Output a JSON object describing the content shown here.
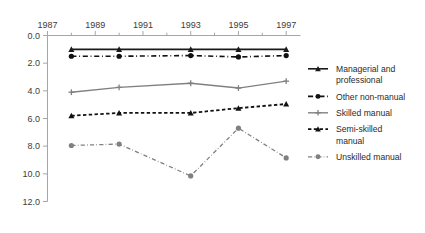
{
  "chart_data": {
    "type": "line",
    "title": "",
    "subtitle": "",
    "xlabel": "",
    "ylabel": "",
    "x": [
      1988,
      1990,
      1993,
      1995,
      1997
    ],
    "xlim": [
      1987,
      1997.6
    ],
    "ylim": [
      0.0,
      12.0
    ],
    "y_axis_inverted": true,
    "x_axis_position": "top",
    "grid": false,
    "legend_position": "right",
    "x_tick_labels": [
      "1987",
      "1989",
      "1991",
      "1993",
      "1995",
      "1997"
    ],
    "x_tick_values": [
      1987,
      1989,
      1991,
      1993,
      1995,
      1997
    ],
    "x_minor_tick_values": [
      1988,
      1990,
      1992,
      1994,
      1996
    ],
    "y_tick_labels": [
      "0.0",
      "2.0",
      "4.0",
      "6.0",
      "8.0",
      "10.0",
      "12.0"
    ],
    "y_tick_values": [
      0.0,
      2.0,
      4.0,
      6.0,
      8.0,
      10.0,
      12.0
    ],
    "series": [
      {
        "name": "Managerial and professional",
        "legend_label_line1": "Managerial and",
        "legend_label_line2": "professional",
        "values": [
          1.0,
          1.0,
          1.0,
          1.0,
          1.0
        ],
        "color": "#1a1a1a",
        "dash": "none",
        "marker": "triangle",
        "width": 1.6
      },
      {
        "name": "Other non-manual",
        "legend_label_line1": "Other non-manual",
        "legend_label_line2": "",
        "values": [
          1.5,
          1.5,
          1.45,
          1.55,
          1.45
        ],
        "color": "#111111",
        "dash": "dashdot",
        "marker": "circle",
        "width": 1.6
      },
      {
        "name": "Skilled manual",
        "legend_label_line1": "Skilled manual",
        "legend_label_line2": "",
        "values": [
          4.1,
          3.75,
          3.45,
          3.8,
          3.3
        ],
        "color": "#808080",
        "dash": "none",
        "marker": "plus",
        "width": 1.4
      },
      {
        "name": "Semi-skilled manual",
        "legend_label_line1": "Semi-skilled",
        "legend_label_line2": "manual",
        "values": [
          5.8,
          5.6,
          5.6,
          5.25,
          4.95
        ],
        "color": "#111111",
        "dash": "dashed",
        "marker": "triangle",
        "width": 1.8
      },
      {
        "name": "Unskilled manual",
        "legend_label_line1": "Unskilled manual",
        "legend_label_line2": "",
        "values": [
          7.95,
          7.85,
          10.15,
          6.7,
          8.85
        ],
        "color": "#808080",
        "dash": "dashdot",
        "marker": "circle",
        "width": 1.3
      }
    ]
  },
  "legend": {
    "entries": [
      {
        "label_line1": "Managerial and",
        "label_line2": "professional"
      },
      {
        "label_line1": "Other non-manual",
        "label_line2": ""
      },
      {
        "label_line1": "Skilled manual",
        "label_line2": ""
      },
      {
        "label_line1": "Semi-skilled",
        "label_line2": "manual"
      },
      {
        "label_line1": "Unskilled manual",
        "label_line2": ""
      }
    ]
  },
  "colors": {
    "axis": "#a6a6a6",
    "tick_text": "#3c3c3c",
    "black_series": "#111111",
    "gray_series": "#808080",
    "background": "#ffffff"
  }
}
